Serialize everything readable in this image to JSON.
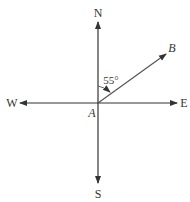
{
  "diagram": {
    "type": "compass-bearing",
    "center_label": "A",
    "point_label": "B",
    "angle_label": "55°",
    "directions": {
      "north": "N",
      "south": "S",
      "east": "E",
      "west": "W"
    },
    "bearing_degrees": 55,
    "line_color": "#333333"
  }
}
